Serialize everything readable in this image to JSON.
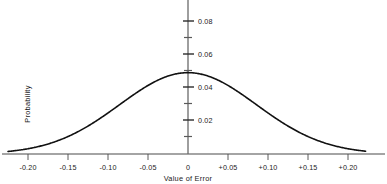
{
  "chart_data": {
    "type": "line",
    "title": "",
    "subtitle": "",
    "xlabel": "Value of Error",
    "ylabel": "Probability",
    "grid": false,
    "legend": false,
    "legend_position": "none",
    "xlim": [
      -0.225,
      0.222
    ],
    "ylim": [
      0.0,
      0.092
    ],
    "x_major_ticks": [
      -0.2,
      -0.15,
      -0.1,
      -0.05,
      0,
      0.05,
      0.1,
      0.15,
      0.2
    ],
    "x_tick_labels": [
      "-0.20",
      "-0.15",
      "-0.10",
      "-0.05",
      "0",
      "+0.05",
      "+0.10",
      "+0.15",
      "+0.20"
    ],
    "y_major_ticks": [
      0.02,
      0.04,
      0.06,
      0.08
    ],
    "y_tick_labels": [
      "0.02",
      "0.04",
      "0.06",
      "0.08"
    ],
    "y_minor_ticks": [
      0.01,
      0.03,
      0.05,
      0.07
    ],
    "distribution": {
      "kind": "normal",
      "mean": 0,
      "sigma": 0.0855,
      "peak": 0.049
    },
    "series": [
      {
        "name": "Probability of Error",
        "x": [
          -0.225,
          -0.215,
          -0.205,
          -0.195,
          -0.185,
          -0.175,
          -0.165,
          -0.155,
          -0.145,
          -0.135,
          -0.125,
          -0.115,
          -0.105,
          -0.095,
          -0.085,
          -0.075,
          -0.065,
          -0.055,
          -0.045,
          -0.035,
          -0.025,
          -0.015,
          -0.005,
          0.0,
          0.005,
          0.015,
          0.025,
          0.035,
          0.045,
          0.055,
          0.065,
          0.075,
          0.085,
          0.095,
          0.105,
          0.115,
          0.125,
          0.135,
          0.145,
          0.155,
          0.165,
          0.175,
          0.185,
          0.195,
          0.205,
          0.215,
          0.222
        ],
        "y": [
          0.0015,
          0.0021,
          0.0028,
          0.0037,
          0.0048,
          0.0062,
          0.0079,
          0.0099,
          0.0123,
          0.0151,
          0.0182,
          0.0216,
          0.0253,
          0.0292,
          0.0331,
          0.0369,
          0.0404,
          0.0435,
          0.046,
          0.0478,
          0.0488,
          0.049,
          0.049,
          0.049,
          0.049,
          0.0488,
          0.0478,
          0.046,
          0.0435,
          0.0404,
          0.0369,
          0.0331,
          0.0292,
          0.0253,
          0.0216,
          0.0182,
          0.0151,
          0.0123,
          0.0099,
          0.0079,
          0.0062,
          0.0048,
          0.0037,
          0.0028,
          0.0021,
          0.0015,
          0.0012
        ]
      }
    ]
  },
  "colors": {
    "curve": "#111111",
    "axis": "#444444",
    "text": "#1b1b1b",
    "background": "#ffffff"
  }
}
